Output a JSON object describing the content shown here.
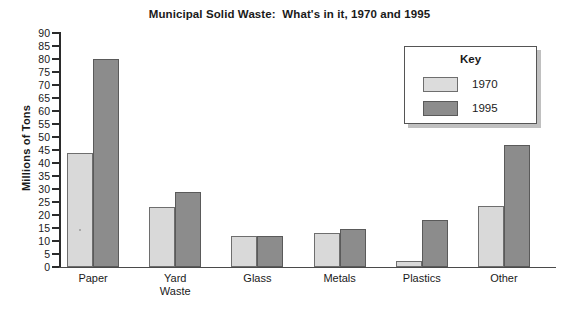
{
  "chart_data": {
    "type": "bar",
    "title": "Municipal Solid Waste:  What's in it, 1970 and 1995",
    "xlabel": "",
    "ylabel": "Millions of Tons",
    "ylim": [
      0,
      90
    ],
    "ytick_step": 5,
    "yticks": [
      90,
      85,
      80,
      75,
      70,
      65,
      60,
      55,
      50,
      45,
      40,
      35,
      30,
      25,
      20,
      15,
      10,
      5,
      0
    ],
    "grid": false,
    "legend_position": "upper right",
    "legend_title": "Key",
    "categories": [
      "Paper",
      "Yard\nWaste",
      "Glass",
      "Metals",
      "Plastics",
      "Other"
    ],
    "series": [
      {
        "name": "1970",
        "color": "#d9d9d9",
        "values": [
          44,
          23,
          12,
          13,
          2.5,
          23.5
        ]
      },
      {
        "name": "1995",
        "color": "#8c8c8c",
        "values": [
          80,
          29,
          12,
          14.5,
          18,
          47
        ]
      }
    ]
  }
}
